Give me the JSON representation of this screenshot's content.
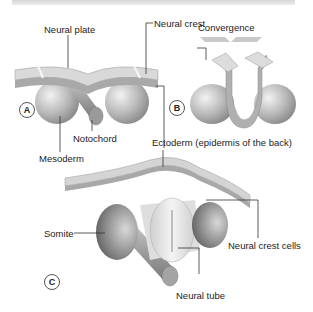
{
  "panels": {
    "a": {
      "marker": "A"
    },
    "b": {
      "marker": "B"
    },
    "c": {
      "marker": "C"
    }
  },
  "labels": {
    "neural_plate": "Neural plate",
    "neural_crest": "Neural crest",
    "convergence": "Convergence",
    "notochord": "Notochord",
    "mesoderm": "Mesoderm",
    "ectoderm": "Ectoderm (epidermis of the back)",
    "somite": "Somite",
    "neural_crest_cells": "Neural crest cells",
    "neural_tube": "Neural tube"
  },
  "colors": {
    "plate_top": "#d9d9d9",
    "plate_side": "#a9a9a9",
    "sphere": "#b5b5b5",
    "tube": "#e6e6e6",
    "leader_line": "#333333"
  }
}
